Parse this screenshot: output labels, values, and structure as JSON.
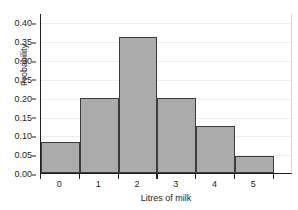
{
  "chart_data": {
    "type": "bar",
    "title": "",
    "subtitle": "",
    "xlabel": "Litres of milk",
    "ylabel": "Probability",
    "categories": [
      "0",
      "1",
      "2",
      "3",
      "4",
      "5"
    ],
    "values": [
      0.082,
      0.2,
      0.36,
      0.2,
      0.125,
      0.045
    ],
    "series": [
      {
        "name": "Probability",
        "values": [
          0.082,
          0.2,
          0.36,
          0.2,
          0.125,
          0.045
        ]
      }
    ],
    "ylim": [
      0.0,
      0.425
    ],
    "xlim": [
      -0.5,
      6.0
    ],
    "ytick_labels": [
      "0.00",
      "0.05",
      "0.10",
      "0.15",
      "0.20",
      "0.25",
      "0.30",
      "0.35",
      "0.40"
    ],
    "ytick_values": [
      0.0,
      0.05,
      0.1,
      0.15,
      0.2,
      0.25,
      0.3,
      0.35,
      0.4
    ],
    "xtick_labels": [
      "0",
      "1",
      "2",
      "3",
      "4",
      "5"
    ],
    "xtick_values": [
      0,
      1,
      2,
      3,
      4,
      5
    ],
    "bin_edges": [
      -0.5,
      0.5,
      1.5,
      2.5,
      3.5,
      4.5,
      5.5
    ],
    "grid": true,
    "grid_axis": "y",
    "legend": false,
    "legend_position": "none",
    "annotations": [],
    "colors": {
      "bar_fill": "#ababab",
      "bar_edge": "#3c3c3c",
      "axis": "#231f20",
      "grid": "#ededed",
      "background": "#ffffff",
      "text": "#231f20"
    }
  }
}
